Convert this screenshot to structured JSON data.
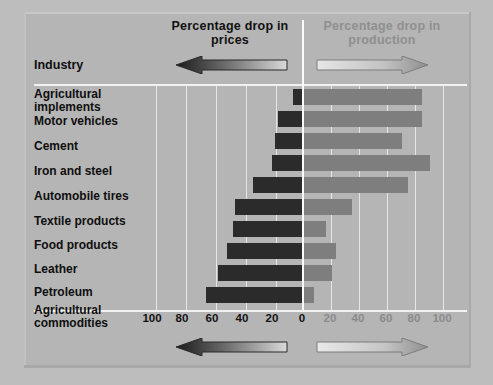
{
  "headers": {
    "left_title": "Percentage\ndrop in prices",
    "right_title": "Percentage\ndrop in production",
    "industry_label": "Industry"
  },
  "colors": {
    "background": "#b5b5b5",
    "negative_bar": "#2b2b2b",
    "positive_bar": "#7e7e7e",
    "gridline": "#eeeeee",
    "zeroline": "#fbfbfb",
    "left_text": "#101010",
    "right_text": "#8f8f8f"
  },
  "icons": {
    "left_arrow": "arrow-left-icon",
    "right_arrow": "arrow-right-icon"
  },
  "axis": {
    "left_ticks": [
      "100",
      "80",
      "60",
      "40",
      "20",
      "0"
    ],
    "right_ticks": [
      "20",
      "40",
      "60",
      "80",
      "100"
    ],
    "max": 100,
    "unit": "percent"
  },
  "chart_data": {
    "type": "bar",
    "orientation": "horizontal",
    "diverging": true,
    "xlabel": "",
    "ylabel": "Industry",
    "xlim": [
      -100,
      100
    ],
    "grid": true,
    "legend_position": "top",
    "categories": [
      "Agricultural implements",
      "Motor vehicles",
      "Cement",
      "Iron and steel",
      "Automobile tires",
      "Textile products",
      "Food products",
      "Leather",
      "Petroleum",
      "Agricultural commodities"
    ],
    "series": [
      {
        "name": "Percentage drop in prices",
        "color": "#2b2b2b",
        "direction": "left",
        "values": [
          6,
          16,
          18,
          20,
          33,
          45,
          46,
          50,
          56,
          64
        ]
      },
      {
        "name": "Percentage drop in production",
        "color": "#7e7e7e",
        "direction": "right",
        "values": [
          84,
          84,
          70,
          90,
          74,
          34,
          16,
          23,
          20,
          7
        ]
      }
    ]
  },
  "rows": [
    {
      "label": "Agricultural\nimplements",
      "price_drop": 6,
      "production_drop": 84,
      "label_top": 2,
      "bar_top": 3
    },
    {
      "label": "Motor vehicles",
      "price_drop": 16,
      "production_drop": 84,
      "label_top": 29,
      "bar_top": 25
    },
    {
      "label": "Cement",
      "price_drop": 18,
      "production_drop": 70,
      "label_top": 54,
      "bar_top": 47
    },
    {
      "label": "Iron and steel",
      "price_drop": 20,
      "production_drop": 90,
      "label_top": 79,
      "bar_top": 69
    },
    {
      "label": "Automobile tires",
      "price_drop": 33,
      "production_drop": 74,
      "label_top": 104,
      "bar_top": 91
    },
    {
      "label": "Textile products",
      "price_drop": 45,
      "production_drop": 34,
      "label_top": 129,
      "bar_top": 113
    },
    {
      "label": "Food products",
      "price_drop": 46,
      "production_drop": 16,
      "label_top": 153,
      "bar_top": 135
    },
    {
      "label": "Leather",
      "price_drop": 50,
      "production_drop": 23,
      "label_top": 177,
      "bar_top": 157
    },
    {
      "label": "Petroleum",
      "price_drop": 56,
      "production_drop": 20,
      "label_top": 200,
      "bar_top": 179
    },
    {
      "label": "Agricultural\ncommodities",
      "price_drop": 64,
      "production_drop": 7,
      "label_top": 218,
      "bar_top": 201
    }
  ]
}
